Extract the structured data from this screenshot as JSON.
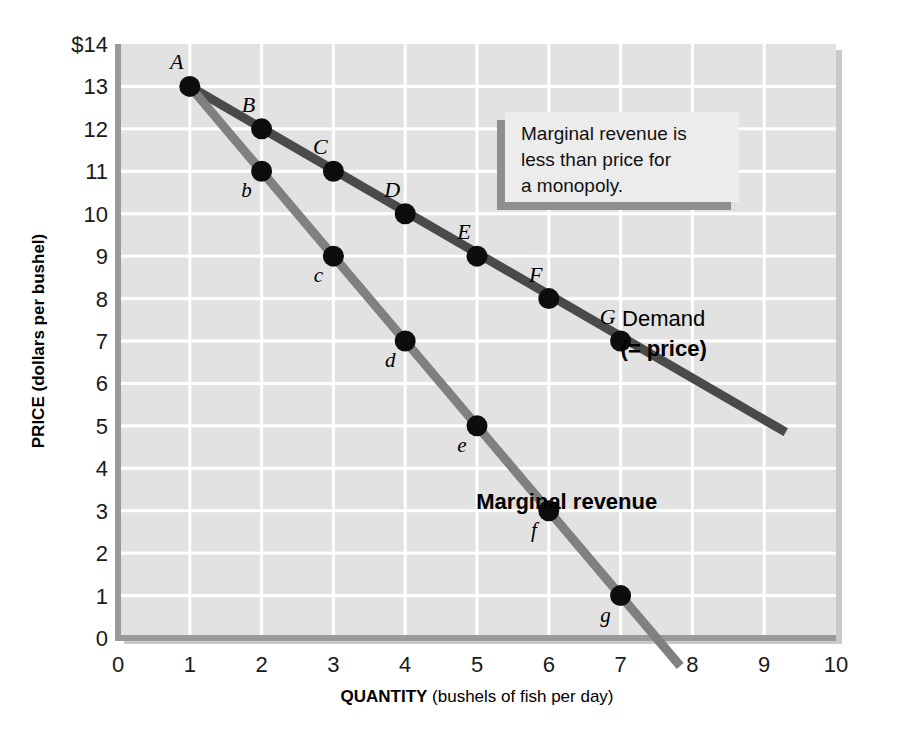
{
  "chart_data": {
    "type": "line",
    "title": "",
    "xlabel_bold": "QUANTITY",
    "xlabel_rest": " (bushels of fish per day)",
    "ylabel_bold": "PRICE",
    "ylabel_rest": " (dollars per bushel)",
    "xlim": [
      0,
      10
    ],
    "ylim": [
      0,
      14
    ],
    "xticks": [
      "0",
      "1",
      "2",
      "3",
      "4",
      "5",
      "6",
      "7",
      "8",
      "9",
      "10"
    ],
    "yticks": [
      "0",
      "1",
      "2",
      "3",
      "4",
      "5",
      "6",
      "7",
      "8",
      "9",
      "10",
      "11",
      "12",
      "13",
      "$14"
    ],
    "grid": true,
    "legend_position": "inline-annotation",
    "series": [
      {
        "name": "Demand (= price)",
        "color": "#4a4a4a",
        "label_line1": "Demand",
        "label_line2": "(= price)",
        "label_line1_bold": false,
        "label_line2_bold": true,
        "label_x": 7.6,
        "label_y": 7.35,
        "line_from": [
          1,
          13
        ],
        "line_to": [
          9.3,
          4.85
        ],
        "point_label_style": "uppercase-italic",
        "points": [
          {
            "label": "A",
            "x": 1,
            "y": 13,
            "label_pos": "above-left"
          },
          {
            "label": "B",
            "x": 2,
            "y": 12,
            "label_pos": "above-left"
          },
          {
            "label": "C",
            "x": 3,
            "y": 11,
            "label_pos": "above-left"
          },
          {
            "label": "D",
            "x": 4,
            "y": 10,
            "label_pos": "above-left"
          },
          {
            "label": "E",
            "x": 5,
            "y": 9,
            "label_pos": "above-left"
          },
          {
            "label": "F",
            "x": 6,
            "y": 8,
            "label_pos": "above-left"
          },
          {
            "label": "G",
            "x": 7,
            "y": 7,
            "label_pos": "above-left"
          }
        ]
      },
      {
        "name": "Marginal revenue",
        "color": "#808080",
        "label_line1": "Marginal revenue",
        "label_line2": "",
        "label_line1_bold": true,
        "label_line2_bold": false,
        "label_x": 6.25,
        "label_y": 3.05,
        "line_from": [
          1,
          13
        ],
        "line_to": [
          7.83,
          -0.66
        ],
        "point_label_style": "lowercase-italic",
        "points": [
          {
            "label": "b",
            "x": 2,
            "y": 11,
            "label_pos": "below-left"
          },
          {
            "label": "c",
            "x": 3,
            "y": 9,
            "label_pos": "below-left"
          },
          {
            "label": "d",
            "x": 4,
            "y": 7,
            "label_pos": "below-left"
          },
          {
            "label": "e",
            "x": 5,
            "y": 5,
            "label_pos": "below-left"
          },
          {
            "label": "f",
            "x": 6,
            "y": 3,
            "label_pos": "below-left"
          },
          {
            "label": "g",
            "x": 7,
            "y": 1,
            "label_pos": "below-left"
          }
        ]
      }
    ],
    "annotations": [
      {
        "id": "callout",
        "lines": [
          "Marginal revenue is",
          "less than price for",
          "a monopoly."
        ],
        "box_x": 505,
        "box_y": 112,
        "box_w": 234,
        "box_h": 90
      }
    ],
    "colors": {
      "plot_background": "#e2e2e2",
      "gridline": "#ffffff",
      "axis_spine": "#9a9a9a",
      "demand": "#4a4a4a",
      "marginal_revenue": "#808080",
      "point_marker": "#0d0d0d",
      "page_background": "#ffffff",
      "callout_fill": "#ececec",
      "callout_shadow": "#8e8e8e"
    }
  }
}
